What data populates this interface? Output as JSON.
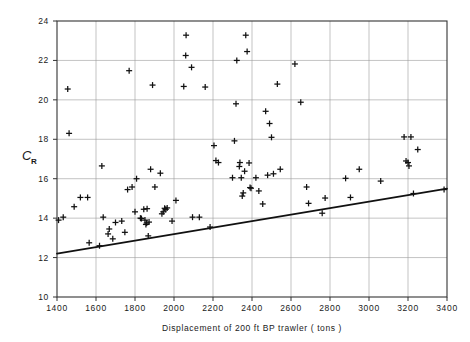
{
  "chart_data": {
    "type": "scatter",
    "title": "",
    "xlabel": "Displacement of 200 ft BP trawler ( tons )",
    "ylabel": "C",
    "ylabel_sub": "R",
    "xlim": [
      1400,
      3400
    ],
    "ylim": [
      10,
      24
    ],
    "xticks": [
      1400,
      1600,
      1800,
      2000,
      2200,
      2400,
      2600,
      2800,
      3000,
      3200,
      3400
    ],
    "yticks": [
      10,
      12,
      14,
      16,
      18,
      20,
      22,
      24
    ],
    "xtick_labels": [
      "1400",
      "1600",
      "1800",
      "2000",
      "2200",
      "2400",
      "2600",
      "2800",
      "3000",
      "3200",
      "3400"
    ],
    "ytick_labels": [
      "10",
      "12",
      "14",
      "16",
      "18",
      "20",
      "22",
      "24"
    ],
    "grid": true,
    "legend": "none",
    "marker": "plus",
    "marker_color": "#111111",
    "series": [
      {
        "name": "CR data",
        "points": [
          [
            1408,
            13.9
          ],
          [
            1432,
            14.05
          ],
          [
            1455,
            20.55
          ],
          [
            1462,
            18.3
          ],
          [
            1488,
            14.58
          ],
          [
            1520,
            15.05
          ],
          [
            1557,
            15.05
          ],
          [
            1565,
            12.75
          ],
          [
            1618,
            12.6
          ],
          [
            1630,
            16.65
          ],
          [
            1637,
            14.05
          ],
          [
            1662,
            13.2
          ],
          [
            1668,
            13.45
          ],
          [
            1686,
            12.95
          ],
          [
            1700,
            13.78
          ],
          [
            1732,
            13.85
          ],
          [
            1748,
            13.28
          ],
          [
            1762,
            15.45
          ],
          [
            1770,
            21.48
          ],
          [
            1785,
            15.58
          ],
          [
            1800,
            14.32
          ],
          [
            1808,
            16.0
          ],
          [
            1828,
            14.0
          ],
          [
            1833,
            13.98
          ],
          [
            1845,
            14.45
          ],
          [
            1851,
            13.9
          ],
          [
            1856,
            13.68
          ],
          [
            1860,
            13.75
          ],
          [
            1862,
            14.48
          ],
          [
            1868,
            13.1
          ],
          [
            1872,
            13.8
          ],
          [
            1880,
            16.48
          ],
          [
            1890,
            20.75
          ],
          [
            1902,
            15.58
          ],
          [
            1930,
            16.28
          ],
          [
            1938,
            14.22
          ],
          [
            1945,
            14.32
          ],
          [
            1952,
            14.5
          ],
          [
            1958,
            14.45
          ],
          [
            1965,
            14.52
          ],
          [
            1990,
            13.85
          ],
          [
            2010,
            14.9
          ],
          [
            2050,
            20.68
          ],
          [
            2060,
            22.25
          ],
          [
            2062,
            23.28
          ],
          [
            2090,
            21.65
          ],
          [
            2095,
            14.05
          ],
          [
            2130,
            14.05
          ],
          [
            2160,
            20.65
          ],
          [
            2185,
            13.55
          ],
          [
            2205,
            17.68
          ],
          [
            2215,
            16.92
          ],
          [
            2228,
            16.82
          ],
          [
            2300,
            16.05
          ],
          [
            2310,
            17.92
          ],
          [
            2318,
            19.8
          ],
          [
            2322,
            22.0
          ],
          [
            2335,
            16.62
          ],
          [
            2338,
            16.82
          ],
          [
            2345,
            16.05
          ],
          [
            2350,
            15.12
          ],
          [
            2355,
            15.28
          ],
          [
            2362,
            16.38
          ],
          [
            2368,
            23.28
          ],
          [
            2375,
            22.45
          ],
          [
            2385,
            16.8
          ],
          [
            2390,
            15.55
          ],
          [
            2395,
            15.52
          ],
          [
            2420,
            16.05
          ],
          [
            2435,
            15.38
          ],
          [
            2455,
            14.72
          ],
          [
            2470,
            19.42
          ],
          [
            2480,
            16.18
          ],
          [
            2490,
            18.8
          ],
          [
            2500,
            18.1
          ],
          [
            2510,
            16.25
          ],
          [
            2530,
            20.8
          ],
          [
            2545,
            16.48
          ],
          [
            2620,
            21.82
          ],
          [
            2650,
            19.88
          ],
          [
            2680,
            15.58
          ],
          [
            2690,
            14.75
          ],
          [
            2760,
            14.25
          ],
          [
            2775,
            15.02
          ],
          [
            2880,
            16.02
          ],
          [
            2905,
            15.05
          ],
          [
            2950,
            16.48
          ],
          [
            3060,
            15.88
          ],
          [
            3180,
            18.12
          ],
          [
            3190,
            16.9
          ],
          [
            3200,
            16.82
          ],
          [
            3205,
            16.65
          ],
          [
            3215,
            18.12
          ],
          [
            3228,
            15.25
          ],
          [
            3250,
            17.48
          ],
          [
            3385,
            15.45
          ]
        ]
      }
    ],
    "trendline": {
      "x": [
        1400,
        3400
      ],
      "y": [
        12.2,
        15.5
      ],
      "color": "#111111",
      "width": 1.8
    }
  }
}
